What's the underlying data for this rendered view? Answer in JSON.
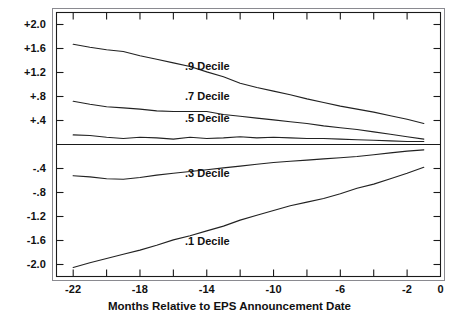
{
  "chart_data": {
    "type": "line",
    "title": "",
    "xlabel": "Months Relative to EPS Announcement Date",
    "ylabel": "",
    "xlim": [
      -23,
      0
    ],
    "ylim": [
      -2.2,
      2.2
    ],
    "grid": false,
    "legend_position": "inline-annotations",
    "x_ticks_major": [
      "-22",
      "-18",
      "-14",
      "-10",
      "-6",
      "-2",
      "0"
    ],
    "x_ticks_major_values": [
      -22,
      -18,
      -14,
      -10,
      -6,
      -2,
      0
    ],
    "x_ticks_minor_values": [
      -20,
      -16,
      -12,
      -8,
      -4
    ],
    "y_ticks": [
      "+2.0",
      "+1.6",
      "+1.2",
      "+.8",
      "+.4",
      "-.4",
      "-.8",
      "-1.2",
      "-1.6",
      "-2.0"
    ],
    "y_ticks_values": [
      2.0,
      1.6,
      1.2,
      0.8,
      0.4,
      -0.4,
      -0.8,
      -1.2,
      -1.6,
      -2.0
    ],
    "zero_line": 0,
    "x": [
      -22,
      -21,
      -20,
      -19,
      -18,
      -17,
      -16,
      -15,
      -14,
      -13,
      -12,
      -11,
      -10,
      -9,
      -8,
      -7,
      -6,
      -5,
      -4,
      -3,
      -2,
      -1
    ],
    "series": [
      {
        "name": ".9 Decile",
        "label": ".9 Decile",
        "label_x": -15.3,
        "label_y": 1.3,
        "values": [
          1.67,
          1.62,
          1.58,
          1.55,
          1.48,
          1.42,
          1.36,
          1.3,
          1.21,
          1.13,
          1.02,
          0.95,
          0.89,
          0.83,
          0.76,
          0.7,
          0.64,
          0.59,
          0.54,
          0.48,
          0.42,
          0.35
        ]
      },
      {
        "name": ".7 Decile",
        "label": ".7 Decile",
        "label_x": -15.3,
        "label_y": 0.79,
        "values": [
          0.72,
          0.67,
          0.63,
          0.61,
          0.59,
          0.56,
          0.55,
          0.55,
          0.55,
          0.5,
          0.47,
          0.44,
          0.41,
          0.38,
          0.35,
          0.31,
          0.28,
          0.25,
          0.21,
          0.17,
          0.13,
          0.09
        ]
      },
      {
        "name": ".5 Decile",
        "label": ".5 Decile",
        "label_x": -15.3,
        "label_y": 0.42,
        "values": [
          0.16,
          0.15,
          0.12,
          0.1,
          0.12,
          0.11,
          0.09,
          0.12,
          0.1,
          0.11,
          0.13,
          0.11,
          0.12,
          0.11,
          0.1,
          0.1,
          0.09,
          0.08,
          0.07,
          0.06,
          0.05,
          0.05
        ]
      },
      {
        "name": ".3 Decile",
        "label": ".3 Decile",
        "label_x": -15.3,
        "label_y": -0.49,
        "values": [
          -0.52,
          -0.54,
          -0.57,
          -0.58,
          -0.55,
          -0.51,
          -0.48,
          -0.45,
          -0.42,
          -0.39,
          -0.36,
          -0.33,
          -0.3,
          -0.28,
          -0.26,
          -0.24,
          -0.22,
          -0.2,
          -0.17,
          -0.14,
          -0.11,
          -0.09
        ]
      },
      {
        "name": ".1 Decile",
        "label": ".1 Decile",
        "label_x": -15.3,
        "label_y": -1.63,
        "values": [
          -2.05,
          -1.97,
          -1.9,
          -1.83,
          -1.76,
          -1.68,
          -1.59,
          -1.52,
          -1.44,
          -1.36,
          -1.26,
          -1.18,
          -1.1,
          -1.02,
          -0.96,
          -0.9,
          -0.82,
          -0.73,
          -0.66,
          -0.57,
          -0.48,
          -0.38
        ]
      }
    ]
  },
  "axis": {
    "x_title": "Months Relative to EPS Announcement Date"
  },
  "colors": {
    "curve": "#222222",
    "frame": "#1a1a1a",
    "text": "#111111",
    "background": "#ffffff"
  }
}
